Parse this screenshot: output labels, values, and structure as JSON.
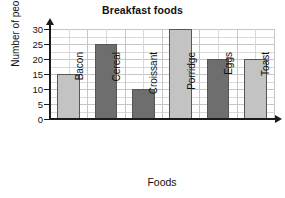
{
  "chart_data": {
    "type": "bar",
    "title": "Breakfast foods",
    "xlabel": "Foods",
    "ylabel": "Number of people",
    "categories": [
      "Bacon",
      "Cereal",
      "Croissant",
      "Porridge",
      "Eggs",
      "Toast"
    ],
    "values": [
      15,
      25,
      10,
      30,
      20,
      20
    ],
    "bar_colors": [
      "#c3c3c3",
      "#6e6e6e",
      "#6e6e6e",
      "#c3c3c3",
      "#6e6e6e",
      "#c3c3c3"
    ],
    "bar_shades": [
      "light",
      "dark",
      "dark",
      "light",
      "dark",
      "light"
    ],
    "ylim": [
      0,
      30
    ],
    "ytick_values": [
      0,
      5,
      10,
      15,
      20,
      25,
      30
    ],
    "ytick_labels": [
      "0",
      "5",
      "10",
      "15",
      "20",
      "25",
      "30"
    ],
    "ytick_step": 5,
    "grid": true,
    "grid_minor": true,
    "legend": false,
    "xtick_label_rotation": -90,
    "axis_color": "#1c1c1c",
    "grid_color": "#d9d9d9",
    "bar_edge_color": "#575757",
    "background": "#ffffff"
  }
}
